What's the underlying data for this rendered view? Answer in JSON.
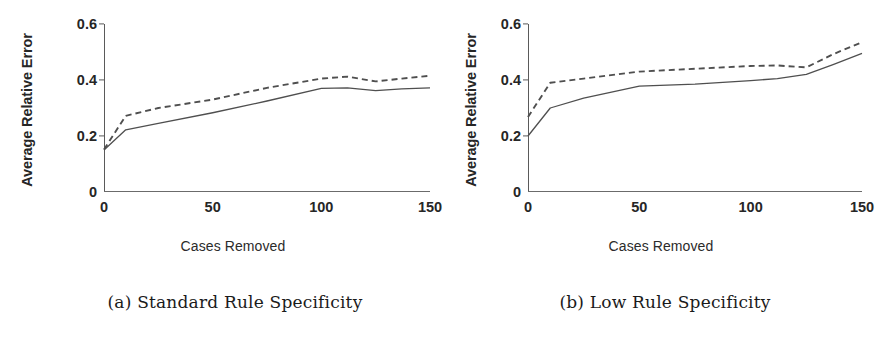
{
  "figure": {
    "background": "#ffffff",
    "line_color": "#4f4f4f",
    "axis_color": "#5a5a5a"
  },
  "panels": [
    {
      "id": "panel-a",
      "caption": "(a) Standard Rule Specificity",
      "chart_data": {
        "type": "line",
        "title": "",
        "xlabel": "Cases Removed",
        "ylabel": "Average Relative Error",
        "xlim": [
          0,
          150
        ],
        "ylim": [
          0,
          0.6
        ],
        "xticks": [
          0,
          50,
          100,
          150
        ],
        "xtick_labels": [
          "0",
          "50",
          "100",
          "150"
        ],
        "yticks": [
          0,
          0.2,
          0.4,
          0.6
        ],
        "ytick_labels": [
          "0",
          "0.2",
          "0.4",
          "0.6"
        ],
        "grid": false,
        "legend": "none",
        "x": [
          0,
          10,
          25,
          50,
          75,
          100,
          112,
          125,
          137,
          150
        ],
        "series": [
          {
            "name": "solid",
            "style": "solid",
            "values": [
              0.15,
              0.222,
              0.245,
              0.283,
              0.325,
              0.37,
              0.372,
              0.362,
              0.368,
              0.372
            ]
          },
          {
            "name": "dashed",
            "style": "dashed",
            "values": [
              0.152,
              0.272,
              0.3,
              0.33,
              0.372,
              0.405,
              0.412,
              0.395,
              0.405,
              0.415
            ]
          }
        ]
      }
    },
    {
      "id": "panel-b",
      "caption": "(b) Low Rule Specificity",
      "chart_data": {
        "type": "line",
        "title": "",
        "xlabel": "Cases Removed",
        "ylabel": "Average Relative Error",
        "xlim": [
          0,
          150
        ],
        "ylim": [
          0,
          0.6
        ],
        "xticks": [
          0,
          50,
          100,
          150
        ],
        "xtick_labels": [
          "0",
          "50",
          "100",
          "150"
        ],
        "yticks": [
          0,
          0.2,
          0.4,
          0.6
        ],
        "ytick_labels": [
          "0",
          "0.2",
          "0.4",
          "0.6"
        ],
        "grid": false,
        "legend": "none",
        "x": [
          0,
          10,
          25,
          50,
          75,
          100,
          112,
          125,
          137,
          150
        ],
        "series": [
          {
            "name": "solid",
            "style": "solid",
            "values": [
              0.2,
              0.3,
              0.335,
              0.378,
              0.385,
              0.398,
              0.405,
              0.42,
              0.455,
              0.495
            ]
          },
          {
            "name": "dashed",
            "style": "dashed",
            "values": [
              0.268,
              0.39,
              0.405,
              0.43,
              0.44,
              0.45,
              0.452,
              0.445,
              0.492,
              0.535
            ]
          }
        ]
      }
    }
  ]
}
